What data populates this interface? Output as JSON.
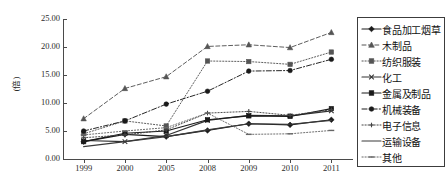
{
  "chart_data": {
    "type": "line",
    "title": "",
    "xlabel": "",
    "ylabel": "(倍)",
    "categories": [
      "1999",
      "2000",
      "2005",
      "2008",
      "2009",
      "2010",
      "2011"
    ],
    "ylim": [
      0,
      25
    ],
    "ytick_labels": [
      "0.00",
      "5.00",
      "10.00",
      "15.00",
      "20.00",
      "25.00"
    ],
    "ytick_values": [
      0,
      5,
      10,
      15,
      20,
      25
    ],
    "grid": false,
    "legend_position": "right",
    "series": [
      {
        "name": "食品加工烟草",
        "marker": "diamond",
        "line_style": "solid",
        "color": "#1a1a1a",
        "values": [
          3.1,
          4.4,
          4.0,
          5.1,
          6.3,
          6.1,
          7.0
        ]
      },
      {
        "name": "木制品",
        "marker": "triangle",
        "line_style": "dashed",
        "color": "#555555",
        "values": [
          7.2,
          12.6,
          14.7,
          20.1,
          20.4,
          19.9,
          22.6
        ]
      },
      {
        "name": "纺织服装",
        "marker": "square",
        "line_style": "dotted",
        "color": "#555555",
        "values": [
          4.5,
          6.8,
          5.9,
          17.5,
          17.4,
          16.9,
          19.1
        ]
      },
      {
        "name": "化工",
        "marker": "cross",
        "line_style": "solid",
        "color": "#333333",
        "values": [
          3.3,
          3.1,
          4.2,
          6.9,
          7.8,
          7.7,
          8.6
        ]
      },
      {
        "name": "金属及制品",
        "marker": "square",
        "line_style": "solid",
        "color": "#1a1a1a",
        "values": [
          3.1,
          4.6,
          5.0,
          7.0,
          7.7,
          7.6,
          9.0
        ]
      },
      {
        "name": "机械装备",
        "marker": "circle",
        "line_style": "dash-dot",
        "color": "#1a1a1a",
        "values": [
          5.0,
          6.8,
          9.8,
          12.1,
          15.7,
          15.8,
          17.8
        ]
      },
      {
        "name": "电子信息",
        "marker": "plus",
        "line_style": "dotted",
        "color": "#444444",
        "values": [
          3.8,
          4.3,
          5.2,
          8.2,
          8.5,
          7.8,
          8.8
        ]
      },
      {
        "name": "运输设备",
        "marker": "none",
        "line_style": "solid",
        "color": "#3a3a3a",
        "values": [
          2.2,
          3.1,
          4.0,
          5.2,
          6.3,
          6.2,
          6.9
        ]
      },
      {
        "name": "其他",
        "marker": "dash",
        "line_style": "dotted",
        "color": "#666666",
        "values": [
          4.3,
          5.0,
          5.6,
          8.2,
          4.4,
          4.5,
          5.1
        ]
      }
    ]
  }
}
